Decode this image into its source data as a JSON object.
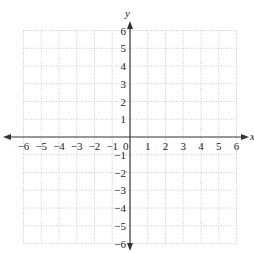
{
  "diagram": {
    "type": "coordinate-plane",
    "x_axis": {
      "label": "x",
      "min": -6,
      "max": 6,
      "ticks": [
        -6,
        -5,
        -4,
        -3,
        -2,
        -1,
        0,
        1,
        2,
        3,
        4,
        5,
        6
      ]
    },
    "y_axis": {
      "label": "y",
      "min": -6,
      "max": 6,
      "ticks": [
        -6,
        -5,
        -4,
        -3,
        -2,
        -1,
        1,
        2,
        3,
        4,
        5,
        6
      ]
    },
    "grid": {
      "style": "dotted",
      "step": 1,
      "color": "#bdbdbd"
    },
    "axis_color": "#333333",
    "origin_label": "0"
  },
  "labels": {
    "x_ticks": [
      "−6",
      "−5",
      "−4",
      "−3",
      "−2",
      "−1",
      "0",
      "1",
      "2",
      "3",
      "4",
      "5",
      "6"
    ],
    "y_ticks_pos": [
      "1",
      "2",
      "3",
      "4",
      "5",
      "6"
    ],
    "y_ticks_neg": [
      "−1",
      "−2",
      "−3",
      "−4",
      "−5",
      "−6"
    ]
  }
}
